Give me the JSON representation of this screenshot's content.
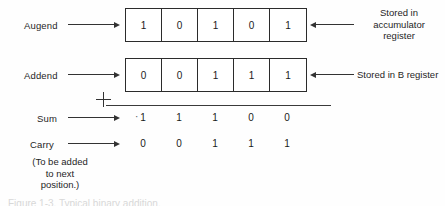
{
  "figure": {
    "rows": [
      {
        "label": "Augend",
        "bits": [
          "1",
          "0",
          "1",
          "0",
          "1"
        ],
        "note": "Stored in\naccumulator\nregister"
      },
      {
        "label": "Addend",
        "bits": [
          "0",
          "0",
          "1",
          "1",
          "1"
        ],
        "note": "Stored in B register"
      }
    ],
    "operator": "+",
    "sum": {
      "label": "Sum",
      "bits": [
        "1",
        "1",
        "1",
        "0",
        "0"
      ],
      "lead_mark": "·"
    },
    "carry": {
      "label": "Carry",
      "bits": [
        "0",
        "0",
        "1",
        "1",
        "1"
      ]
    },
    "footnote": "(To be added\nto next\nposition.)",
    "caption": "Figure 1-3.   Typical binary addition.",
    "colors": {
      "ink": "#1a1a1a",
      "rule": "#3a3a3a",
      "box_border": "#2b2b2b",
      "background": "#fefefe"
    }
  }
}
